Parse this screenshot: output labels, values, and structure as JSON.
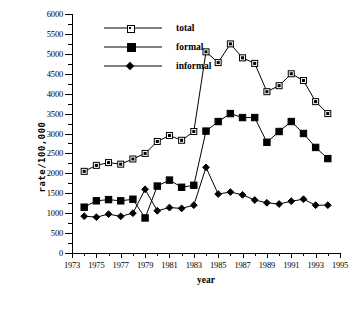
{
  "chart_data": {
    "type": "line",
    "title": "",
    "xlabel": "year",
    "ylabel": "rate/100,000",
    "xlim": [
      1973,
      1995
    ],
    "ylim": [
      0,
      6000
    ],
    "grid": false,
    "legend_position": "top-left",
    "x": [
      1974,
      1975,
      1976,
      1977,
      1978,
      1979,
      1980,
      1981,
      1982,
      1983,
      1984,
      1985,
      1986,
      1987,
      1988,
      1989,
      1990,
      1991,
      1992,
      1993,
      1994
    ],
    "xticks": [
      1973,
      1975,
      1977,
      1979,
      1981,
      1983,
      1985,
      1987,
      1989,
      1991,
      1993,
      1995
    ],
    "xticklabels": [
      "1973",
      "1975",
      "1977",
      "1979",
      "1981",
      "1983",
      "1985",
      "1987",
      "1989",
      "1991",
      "1993",
      "1995"
    ],
    "yticks": [
      0,
      500,
      1000,
      1500,
      2000,
      2500,
      3000,
      3500,
      4000,
      4500,
      5000,
      5500,
      6000
    ],
    "yticklabels": [
      "0",
      "500",
      "1000",
      "1500",
      "2000",
      "2500",
      "3000",
      "3500",
      "4000",
      "4500",
      "5000",
      "5500",
      "6000"
    ],
    "series": [
      {
        "name": "total",
        "marker": "open-square",
        "values": [
          2050,
          2200,
          2270,
          2230,
          2360,
          2500,
          2800,
          2950,
          2830,
          3050,
          5050,
          4780,
          5250,
          4900,
          4760,
          4050,
          4200,
          4500,
          4330,
          3800,
          3500
        ]
      },
      {
        "name": "formal",
        "marker": "filled-square",
        "values": [
          1150,
          1310,
          1340,
          1310,
          1350,
          880,
          1680,
          1830,
          1650,
          1700,
          3060,
          3300,
          3500,
          3400,
          3400,
          2780,
          3050,
          3300,
          3000,
          2650,
          2370
        ]
      },
      {
        "name": "informal",
        "marker": "filled-diamond",
        "values": [
          925,
          900,
          975,
          920,
          1000,
          1600,
          1060,
          1140,
          1120,
          1200,
          2150,
          1480,
          1530,
          1460,
          1330,
          1260,
          1230,
          1300,
          1350,
          1200,
          1200
        ]
      }
    ]
  },
  "legend": {
    "items": [
      {
        "label": "total"
      },
      {
        "label": "formal"
      },
      {
        "label": "informal"
      }
    ]
  },
  "axes": {
    "x_title": "year",
    "y_title": "rate/100,000"
  },
  "colors": {
    "line": "#000000",
    "background": "#ffffff",
    "marker_open_fill": "#ffffff"
  }
}
